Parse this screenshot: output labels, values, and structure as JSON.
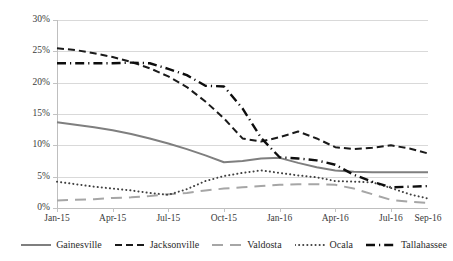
{
  "chart_data": {
    "type": "line",
    "title": "",
    "subtitle": "",
    "xlabel": "",
    "ylabel": "",
    "ylim": [
      0,
      30
    ],
    "yticks": [
      0,
      5,
      10,
      15,
      20,
      25,
      30
    ],
    "ytick_labels": [
      "0%",
      "5%",
      "10%",
      "15%",
      "20%",
      "25%",
      "30%"
    ],
    "grid": true,
    "legend_position": "bottom",
    "x": [
      "Jan-15",
      "Feb-15",
      "Mar-15",
      "Apr-15",
      "May-15",
      "Jun-15",
      "Jul-15",
      "Aug-15",
      "Sep-15",
      "Oct-15",
      "Nov-15",
      "Dec-15",
      "Jan-16",
      "Feb-16",
      "Mar-16",
      "Apr-16",
      "May-16",
      "Jun-16",
      "Jul-16",
      "Aug-16",
      "Sep-16"
    ],
    "xtick_labels": [
      "Jan-15",
      "Apr-15",
      "Jul-15",
      "Oct-15",
      "Jan-16",
      "Apr-16",
      "Jul-16",
      "Sep-16"
    ],
    "xtick_indices": [
      0,
      3,
      6,
      9,
      12,
      15,
      18,
      20
    ],
    "series": [
      {
        "name": "Gainesville",
        "style": "solid",
        "color": "#7f7f7f",
        "width": 2.0,
        "values": [
          13.7,
          13.3,
          12.9,
          12.4,
          11.8,
          11.1,
          10.3,
          9.4,
          8.4,
          7.3,
          7.5,
          7.9,
          8.0,
          7.2,
          6.5,
          6.0,
          5.8,
          5.7,
          5.7,
          5.7,
          5.7
        ]
      },
      {
        "name": "Jacksonville",
        "style": "dashed",
        "color": "#1a1a1a",
        "width": 2.0,
        "values": [
          25.5,
          25.2,
          24.7,
          24.1,
          23.3,
          22.3,
          21.0,
          19.3,
          17.0,
          14.3,
          11.1,
          10.6,
          11.3,
          12.2,
          11.1,
          9.7,
          9.4,
          9.6,
          10.0,
          9.5,
          8.7
        ]
      },
      {
        "name": "Valdosta",
        "style": "longdash",
        "color": "#a6a6a6",
        "width": 2.0,
        "values": [
          1.2,
          1.3,
          1.4,
          1.6,
          1.7,
          1.9,
          2.2,
          2.4,
          2.8,
          3.1,
          3.3,
          3.5,
          3.7,
          3.8,
          3.8,
          3.7,
          3.1,
          2.2,
          1.3,
          1.0,
          0.8
        ]
      },
      {
        "name": "Ocala",
        "style": "dotted",
        "color": "#404040",
        "width": 2.0,
        "values": [
          4.2,
          3.8,
          3.4,
          3.1,
          2.8,
          2.4,
          2.1,
          3.0,
          4.3,
          5.1,
          5.6,
          6.0,
          5.6,
          5.2,
          4.9,
          4.3,
          4.2,
          4.1,
          3.2,
          2.2,
          1.5
        ]
      },
      {
        "name": "Tallahassee",
        "style": "dashdot",
        "color": "#0d0d0d",
        "width": 2.4,
        "values": [
          23.1,
          23.1,
          23.1,
          23.1,
          23.2,
          23.1,
          22.2,
          21.2,
          19.5,
          19.4,
          15.9,
          11.2,
          8.1,
          7.9,
          7.6,
          6.9,
          5.3,
          4.2,
          3.3,
          3.4,
          3.5
        ]
      }
    ]
  },
  "legend": {
    "items": [
      {
        "label": "Gainesville"
      },
      {
        "label": "Jacksonville"
      },
      {
        "label": "Valdosta"
      },
      {
        "label": "Ocala"
      },
      {
        "label": "Tallahassee"
      }
    ]
  }
}
